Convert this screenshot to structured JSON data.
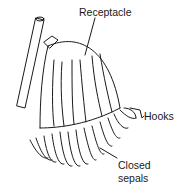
{
  "figure": {
    "labels": {
      "receptacle": "Receptacle",
      "hooks": "Hooks",
      "closed_sepals_line1": "Closed",
      "closed_sepals_line2": "sepals"
    }
  }
}
